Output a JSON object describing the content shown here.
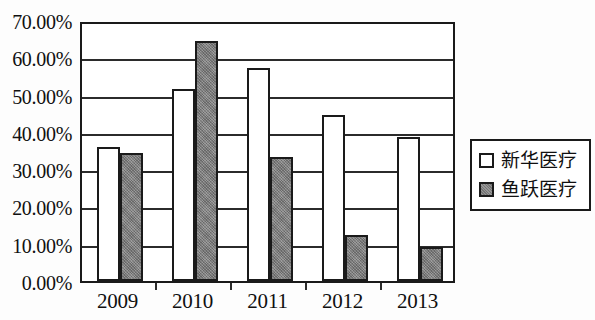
{
  "chart_data": {
    "type": "bar",
    "title": "",
    "subtitle": "",
    "xlabel": "",
    "ylabel": "",
    "categories": [
      "2009",
      "2010",
      "2011",
      "2012",
      "2013"
    ],
    "series": [
      {
        "name": "新华医疗",
        "values": [
          36.0,
          51.6,
          57.0,
          44.4,
          38.6
        ],
        "color": "#ffffff"
      },
      {
        "name": "鱼跃医疗",
        "values": [
          34.2,
          64.5,
          33.3,
          12.3,
          9.1
        ],
        "color": "#8a8a8a"
      }
    ],
    "ylim": [
      0,
      70
    ],
    "ytick_values": [
      0,
      10,
      20,
      30,
      40,
      50,
      60,
      70
    ],
    "ytick_labels": [
      "0.00%",
      "10.00%",
      "20.00%",
      "30.00%",
      "40.00%",
      "50.00%",
      "60.00%",
      "70.00%"
    ],
    "grid": true,
    "grid_axis": "y",
    "legend_position": "right",
    "value_format": "percent"
  },
  "legend": {
    "items": [
      {
        "label": "新华医疗",
        "swatch": "hollow-square"
      },
      {
        "label": "鱼跃医疗",
        "swatch": "filled-gray-square"
      }
    ]
  }
}
